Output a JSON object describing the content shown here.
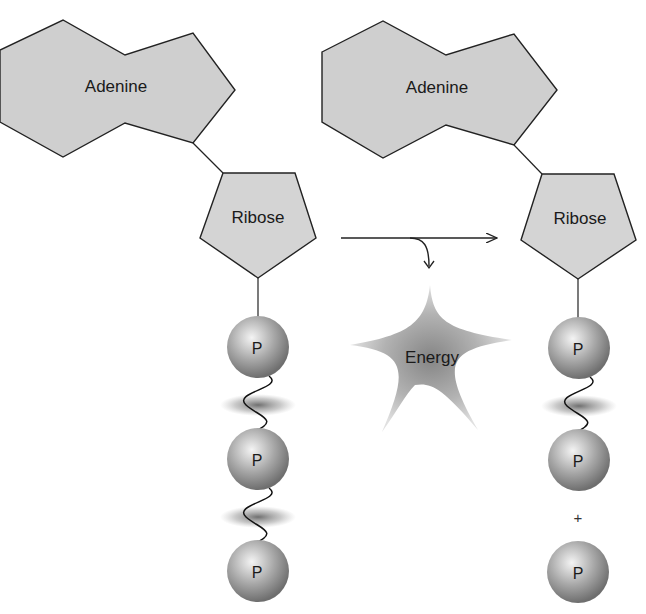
{
  "diagram": {
    "colors": {
      "shape_fill": "#cfcfcf",
      "stroke": "#222222",
      "background": "#ffffff"
    },
    "left_molecule": {
      "base_label": "Adenine",
      "sugar_label": "Ribose",
      "phosphates": [
        "P",
        "P",
        "P"
      ],
      "high_energy_bonds": 2
    },
    "reaction": {
      "arrow": "right-arrow",
      "product_label": "Energy"
    },
    "right_molecule": {
      "base_label": "Adenine",
      "sugar_label": "Ribose",
      "phosphates": [
        "P",
        "P"
      ],
      "high_energy_bonds": 1,
      "separator": "+",
      "free_phosphate": "P"
    }
  }
}
